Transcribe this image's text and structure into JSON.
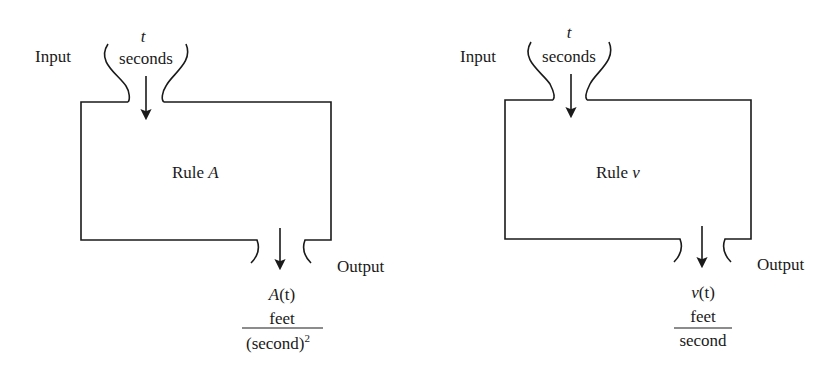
{
  "diagrams": [
    {
      "input_label": "Input",
      "input_var": "t",
      "input_unit": "seconds",
      "rule_prefix": "Rule ",
      "rule_name": "A",
      "output_label": "Output",
      "output_fn": "A",
      "output_arg": "(t)",
      "output_fn_full": "A(t)",
      "unit_numerator": "feet",
      "unit_denominator": "(second)",
      "unit_denominator_exp": "2"
    },
    {
      "input_label": "Input",
      "input_var": "t",
      "input_unit": "seconds",
      "rule_prefix": "Rule ",
      "rule_name": "v",
      "output_label": "Output",
      "output_fn": "v",
      "output_arg": "(t)",
      "output_fn_full": "v(t)",
      "unit_numerator": "feet",
      "unit_denominator": "second"
    }
  ]
}
